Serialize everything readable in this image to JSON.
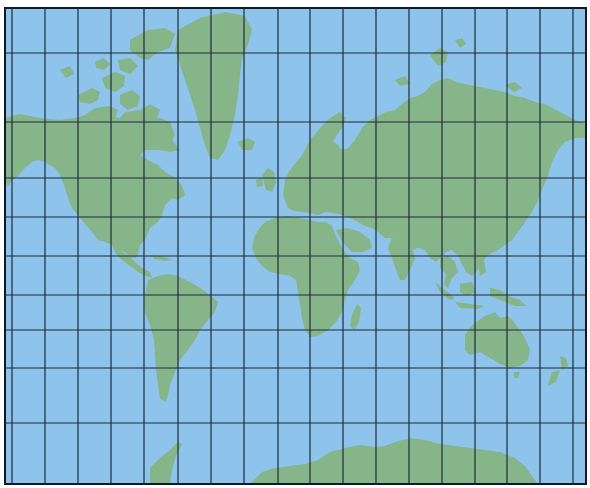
{
  "map": {
    "projection": "Mercator world map",
    "colors": {
      "water": "#8ec3ec",
      "land": "#86b58a",
      "grid": "#1c2a3a",
      "frame": "#111a24",
      "background": "#ffffff"
    },
    "frame": {
      "x": 5,
      "y": 8,
      "width": 581,
      "height": 476
    },
    "grid": {
      "vertical_lines_x": [
        12,
        45,
        78,
        111,
        144,
        178,
        211,
        244,
        278,
        310,
        343,
        376,
        409,
        442,
        475,
        507,
        540,
        573
      ],
      "horizontal_lines_y": [
        53,
        122,
        178,
        217,
        256,
        295,
        330,
        368,
        423
      ]
    },
    "landmasses": [
      "north-america",
      "greenland",
      "canadian-arctic-archipelago",
      "south-america",
      "europe",
      "africa",
      "asia",
      "australia",
      "new-zealand",
      "antarctica",
      "madagascar",
      "japan",
      "indonesia",
      "british-isles",
      "iceland"
    ]
  }
}
